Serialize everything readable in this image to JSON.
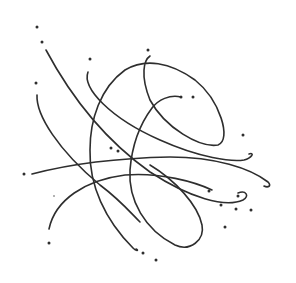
{
  "image": {
    "description": "Abstract hand-drawn scribble of intersecting curved lines with scattered dots",
    "background_color": "#ffffff",
    "ink_color": "#2e2e2e",
    "width": 296,
    "height": 283
  },
  "strokes": [
    {
      "id": "long-diagonal",
      "d": "M46 50 C70 95, 105 140, 150 172 C190 198, 225 208, 243 200 C250 196, 246 190, 238 193"
    },
    {
      "id": "left-arc",
      "d": "M37 95 C36 115, 58 150, 100 185 C120 200, 130 212, 140 222"
    },
    {
      "id": "upper-sweep",
      "d": "M88 72 C82 88, 110 118, 160 140 C200 158, 232 162, 244 160 C252 158, 255 152, 249 154"
    },
    {
      "id": "big-loop",
      "d": "M150 56 C144 60, 140 75, 150 100 C165 128, 200 148, 218 145 C232 140, 220 100, 195 80 C170 62, 145 58, 125 70 C100 88, 90 120, 90 150 C89 185, 105 220, 133 248 C137 252, 139 250, 136 249"
    },
    {
      "id": "inner-arc",
      "d": "M181 97 C170 94, 158 100, 152 108 C140 124, 132 145, 130 170 C128 200, 145 230, 175 245 C190 252, 205 240, 202 225 C198 205, 175 180, 150 165"
    },
    {
      "id": "lower-arc",
      "d": "M49 229 C55 200, 85 180, 125 175 C160 172, 195 182, 212 190"
    },
    {
      "id": "horizon",
      "d": "M32 174 C70 164, 120 158, 170 157 C215 157, 250 168, 268 182 C272 186, 268 188, 264 186"
    }
  ],
  "dots": [
    {
      "cx": 37,
      "cy": 27
    },
    {
      "cx": 42,
      "cy": 42
    },
    {
      "cx": 90,
      "cy": 59
    },
    {
      "cx": 36,
      "cy": 83
    },
    {
      "cx": 148,
      "cy": 50
    },
    {
      "cx": 181,
      "cy": 97
    },
    {
      "cx": 193,
      "cy": 97
    },
    {
      "cx": 243,
      "cy": 135
    },
    {
      "cx": 111,
      "cy": 148
    },
    {
      "cx": 118,
      "cy": 151
    },
    {
      "cx": 24,
      "cy": 174
    },
    {
      "cx": 209,
      "cy": 191
    },
    {
      "cx": 238,
      "cy": 196
    },
    {
      "cx": 221,
      "cy": 205
    },
    {
      "cx": 236,
      "cy": 209
    },
    {
      "cx": 251,
      "cy": 210
    },
    {
      "cx": 225,
      "cy": 227
    },
    {
      "cx": 49,
      "cy": 243
    },
    {
      "cx": 143,
      "cy": 253
    },
    {
      "cx": 156,
      "cy": 260
    },
    {
      "cx": 54,
      "cy": 196,
      "r": 0.7
    }
  ]
}
